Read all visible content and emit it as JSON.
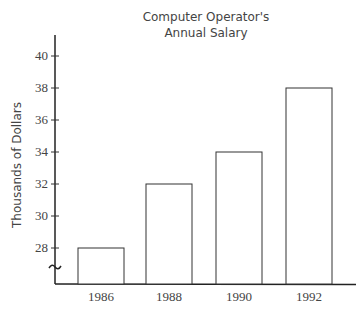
{
  "chart_data": {
    "type": "bar",
    "title": "Computer Operator's Annual Salary",
    "title_lines": [
      "Computer Operator's",
      "Annual Salary"
    ],
    "xlabel": "",
    "ylabel": "Thousands of Dollars",
    "categories": [
      "1986",
      "1988",
      "1990",
      "1992"
    ],
    "values": [
      28,
      32,
      34,
      38
    ],
    "yticks": [
      28,
      30,
      32,
      34,
      36,
      38,
      40
    ],
    "ylim": [
      26,
      41
    ],
    "axis_break": true,
    "grid": false,
    "bar_fill": "#ffffff",
    "bar_stroke": "#333333"
  }
}
